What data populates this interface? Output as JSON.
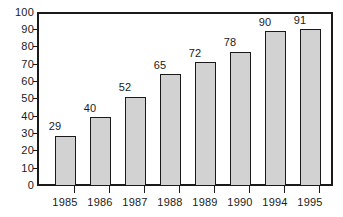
{
  "chart_data": {
    "type": "bar",
    "title": "",
    "subtitle": "",
    "xlabel": "",
    "ylabel": "",
    "categories": [
      "1985",
      "1986",
      "1987",
      "1988",
      "1989",
      "1990",
      "1994",
      "1995"
    ],
    "values": [
      29,
      40,
      52,
      65,
      72,
      78,
      90,
      91
    ],
    "data_labels": [
      "29",
      "40",
      "52",
      "65",
      "72",
      "78",
      "90",
      "91"
    ],
    "ylim": [
      0,
      100
    ],
    "ytick_labels": [
      "100",
      "90",
      "80",
      "70",
      "60",
      "50",
      "40",
      "30",
      "20",
      "10",
      "0"
    ],
    "ytick_values": [
      100,
      90,
      80,
      70,
      60,
      50,
      40,
      30,
      20,
      10,
      0
    ],
    "ytick_step": 10,
    "grid": false,
    "legend": false,
    "legend_position": "none",
    "colors": {
      "bar_fill": "#d2d2d2",
      "bar_border": "#1a1a1a",
      "axis": "#1a1a1a",
      "text": "#1a1a1a",
      "background": "#ffffff"
    }
  }
}
